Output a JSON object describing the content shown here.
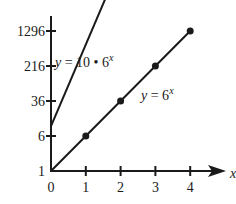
{
  "chart_data": {
    "type": "line",
    "title": "",
    "xlabel": "x",
    "ylabel": "",
    "yscale": "log6",
    "xlim": [
      0,
      4
    ],
    "ylim": [
      1,
      1296
    ],
    "x_ticks": [
      0,
      1,
      2,
      3,
      4
    ],
    "x_tick_labels": [
      "0",
      "1",
      "2",
      "3",
      "4"
    ],
    "y_ticks": [
      1,
      6,
      36,
      216,
      1296
    ],
    "y_tick_labels": [
      "1",
      "6",
      "36",
      "216",
      "1296"
    ],
    "grid": false,
    "series": [
      {
        "name": "y = 10 · 6^x",
        "label_prefix": "y = 10 • 6",
        "label_exp": "x",
        "x": [
          0,
          2.9
        ],
        "y": [
          10,
          1802990
        ],
        "markers": false
      },
      {
        "name": "y = 6^x",
        "label_prefix": "y = 6",
        "label_exp": "x",
        "x": [
          0,
          1,
          2,
          3,
          4
        ],
        "y": [
          1,
          6,
          36,
          216,
          1296
        ],
        "markers": true,
        "marker_x": [
          1,
          2,
          3,
          4
        ]
      }
    ]
  }
}
